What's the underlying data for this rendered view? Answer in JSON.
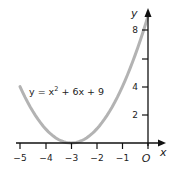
{
  "chart_data": {
    "type": "line",
    "title": "",
    "annotation": "y = x² + 6x + 9",
    "xlabel": "x",
    "ylabel": "y",
    "origin_label": "O",
    "xlim": [
      -5,
      0
    ],
    "ylim": [
      0,
      9
    ],
    "x_ticks": [
      -5,
      -4,
      -3,
      -2,
      -1,
      0
    ],
    "x_tick_labels": [
      "−5",
      "−4",
      "−3",
      "−2",
      "−1",
      "O"
    ],
    "y_ticks": [
      2,
      4,
      6,
      8
    ],
    "y_tick_labels": [
      "2",
      "4",
      "",
      "8"
    ],
    "grid": false,
    "series": [
      {
        "name": "y = x² + 6x + 9",
        "color": "#b3b3b3",
        "x": [
          -5,
          -4.5,
          -4,
          -3.5,
          -3,
          -2.5,
          -2,
          -1.5,
          -1,
          -0.5,
          0
        ],
        "y": [
          4,
          2.25,
          1,
          0.25,
          0,
          0.25,
          1,
          2.25,
          4,
          6.25,
          9
        ]
      }
    ]
  },
  "labels": {
    "equation_prefix": "y = x",
    "equation_exp": "2",
    "equation_suffix": " + 6x + 9",
    "x_axis": "x",
    "y_axis": "y",
    "origin": "O",
    "xt": [
      "−5",
      "−4",
      "−3",
      "−2",
      "−1"
    ],
    "yt": [
      "2",
      "4",
      "8"
    ]
  }
}
